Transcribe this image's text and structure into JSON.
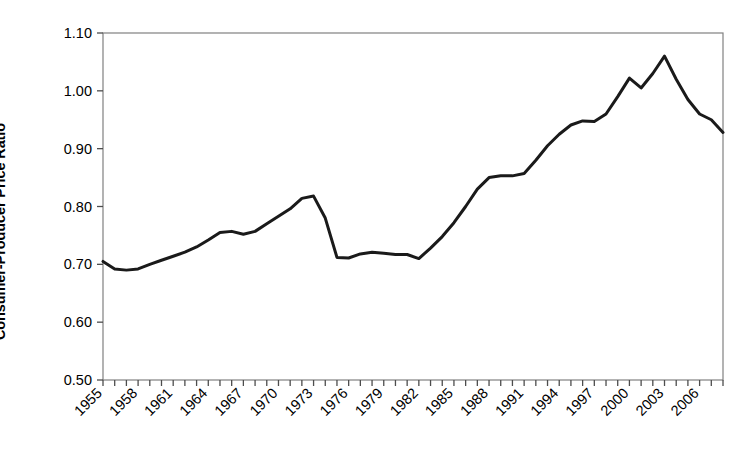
{
  "chart_data": {
    "type": "line",
    "title": "",
    "xlabel": "",
    "ylabel": "Consumer-Producer Price Ratio",
    "ylim": [
      0.5,
      1.1
    ],
    "xlim": [
      1955,
      2008
    ],
    "yticks": [
      "0.50",
      "0.60",
      "0.70",
      "0.80",
      "0.90",
      "1.00",
      "1.10"
    ],
    "ytick_values": [
      0.5,
      0.6,
      0.7,
      0.8,
      0.9,
      1.0,
      1.1
    ],
    "xticks": [
      "1955",
      "1958",
      "1961",
      "1964",
      "1967",
      "1970",
      "1973",
      "1976",
      "1979",
      "1982",
      "1985",
      "1988",
      "1991",
      "1994",
      "1997",
      "2000",
      "2003",
      "2006"
    ],
    "xtick_values": [
      1955,
      1958,
      1961,
      1964,
      1967,
      1970,
      1973,
      1976,
      1979,
      1982,
      1985,
      1988,
      1991,
      1994,
      1997,
      2000,
      2003,
      2006
    ],
    "xtick_minor_step": 1,
    "grid": false,
    "legend": false,
    "legend_position": "none",
    "line_color": "#1a1a1a",
    "line_width": 3,
    "axis_color": "#808080",
    "x": [
      1955,
      1956,
      1957,
      1958,
      1959,
      1960,
      1961,
      1962,
      1963,
      1964,
      1965,
      1966,
      1967,
      1968,
      1969,
      1970,
      1971,
      1972,
      1973,
      1974,
      1975,
      1976,
      1977,
      1978,
      1979,
      1980,
      1981,
      1982,
      1983,
      1984,
      1985,
      1986,
      1987,
      1988,
      1989,
      1990,
      1991,
      1992,
      1993,
      1994,
      1995,
      1996,
      1997,
      1998,
      1999,
      2000,
      2001,
      2002,
      2003,
      2004,
      2005,
      2006,
      2007,
      2008
    ],
    "values": [
      0.705,
      0.692,
      0.69,
      0.692,
      0.7,
      0.707,
      0.714,
      0.721,
      0.73,
      0.742,
      0.755,
      0.757,
      0.752,
      0.757,
      0.77,
      0.783,
      0.796,
      0.814,
      0.818,
      0.78,
      0.712,
      0.711,
      0.718,
      0.721,
      0.719,
      0.717,
      0.717,
      0.71,
      0.728,
      0.748,
      0.772,
      0.8,
      0.83,
      0.85,
      0.853,
      0.853,
      0.857,
      0.88,
      0.905,
      0.925,
      0.941,
      0.948,
      0.947,
      0.96,
      0.99,
      1.022,
      1.005,
      1.03,
      1.06,
      1.02,
      0.985,
      0.96,
      0.95,
      0.928
    ],
    "series": [
      {
        "name": "Consumer-Producer Price Ratio",
        "values": [
          0.705,
          0.692,
          0.69,
          0.692,
          0.7,
          0.707,
          0.714,
          0.721,
          0.73,
          0.742,
          0.755,
          0.757,
          0.752,
          0.757,
          0.77,
          0.783,
          0.796,
          0.814,
          0.818,
          0.78,
          0.712,
          0.711,
          0.718,
          0.721,
          0.719,
          0.717,
          0.717,
          0.71,
          0.728,
          0.748,
          0.772,
          0.8,
          0.83,
          0.85,
          0.853,
          0.853,
          0.857,
          0.88,
          0.905,
          0.925,
          0.941,
          0.948,
          0.947,
          0.96,
          0.99,
          1.022,
          1.005,
          1.03,
          1.06,
          1.02,
          0.985,
          0.96,
          0.95,
          0.928
        ]
      }
    ]
  }
}
